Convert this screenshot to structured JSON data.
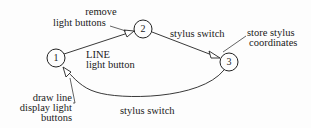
{
  "diagram": {
    "type": "state-transition",
    "nodes": [
      {
        "id": "1",
        "label": "1"
      },
      {
        "id": "2",
        "label": "2"
      },
      {
        "id": "3",
        "label": "3"
      }
    ],
    "edges": [
      {
        "from": "1",
        "to": "2",
        "label_line1": "LINE",
        "label_line2": "light button",
        "action_line1": "remove",
        "action_line2": "light buttons"
      },
      {
        "from": "2",
        "to": "3",
        "label": "stylus switch",
        "action_line1": "store stylus",
        "action_line2": "coordinates"
      },
      {
        "from": "3",
        "to": "1",
        "label": "stylus  switch",
        "action_line1": "draw line",
        "action_line2": "display light",
        "action_line3": "buttons"
      }
    ]
  }
}
